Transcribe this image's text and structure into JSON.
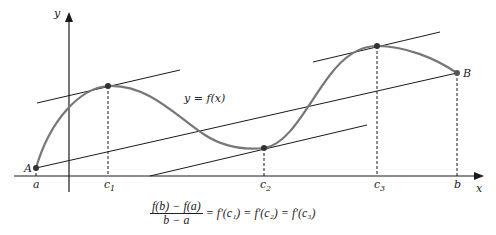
{
  "figure": {
    "axis_labels": {
      "x": "x",
      "y": "y"
    },
    "curve_label": "y = f(x)",
    "points": [
      {
        "label": "A",
        "x": 36,
        "y": 168
      },
      {
        "label": "B",
        "x": 457,
        "y": 73
      },
      {
        "label": "c1",
        "x": 108,
        "y": 86
      },
      {
        "label": "c2",
        "x": 264,
        "y": 148
      },
      {
        "label": "c3",
        "x": 377,
        "y": 46
      }
    ],
    "tick_labels": {
      "a": "a",
      "c1": "c",
      "c1_sub": "1",
      "c2": "c",
      "c2_sub": "2",
      "c3": "c",
      "c3_sub": "3",
      "b": "b"
    },
    "point_labels": {
      "A": "A",
      "B": "B"
    },
    "formula": {
      "numerator": "f(b) − f(a)",
      "denominator": "b − a",
      "rhs": "= f′(c₁) = f′(c₂) = f′(c₃)"
    },
    "colors": {
      "curve": "#777777",
      "lines": "#1a1a1a",
      "points": "#333333"
    }
  }
}
